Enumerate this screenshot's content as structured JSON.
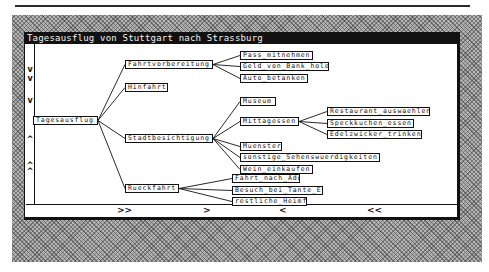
{
  "window": {
    "title": "Tagesausflug von Stuttgart nach Strassburg"
  },
  "scrollbars": {
    "vertical_marks": [
      {
        "glyph": "v",
        "y": 69
      },
      {
        "glyph": "v",
        "y": 78
      },
      {
        "glyph": "v",
        "y": 100
      },
      {
        "glyph": "^",
        "y": 139
      },
      {
        "glyph": "^",
        "y": 165
      },
      {
        "glyph": "^",
        "y": 171
      }
    ],
    "horizontal_marks": [
      {
        "glyph": ">>",
        "x": 116
      },
      {
        "glyph": ">",
        "x": 202
      },
      {
        "glyph": "<",
        "x": 278
      },
      {
        "glyph": "<<",
        "x": 366
      }
    ]
  },
  "tree": {
    "root": {
      "id": "tagesausflug",
      "label": "Tagesausflug",
      "x": 33,
      "y": 116,
      "w": 65
    },
    "nodes": [
      {
        "id": "fahrtvorbereitung",
        "label": "Fahrtvorbereitung",
        "parent": "tagesausflug",
        "x": 125,
        "y": 60,
        "w": 88
      },
      {
        "id": "hinfahrt",
        "label": "Hinfahrt",
        "parent": "tagesausflug",
        "x": 125,
        "y": 83,
        "w": 43
      },
      {
        "id": "stadtbesichtigung",
        "label": "Stadtbesichtigung",
        "parent": "tagesausflug",
        "x": 125,
        "y": 134,
        "w": 88
      },
      {
        "id": "rueckfahrt",
        "label": "Rueckfahrt",
        "parent": "tagesausflug",
        "x": 125,
        "y": 184,
        "w": 54
      },
      {
        "id": "pass",
        "label": "Pass_mitnehmen",
        "parent": "fahrtvorbereitung",
        "x": 240,
        "y": 51,
        "w": 73
      },
      {
        "id": "geld",
        "label": "Geld_von_Bank_holen",
        "parent": "fahrtvorbereitung",
        "x": 240,
        "y": 62,
        "w": 89
      },
      {
        "id": "auto",
        "label": "Auto_betanken",
        "parent": "fahrtvorbereitung",
        "x": 240,
        "y": 74,
        "w": 68
      },
      {
        "id": "museum",
        "label": "Museum",
        "parent": "stadtbesichtigung",
        "x": 240,
        "y": 97,
        "w": 36
      },
      {
        "id": "mittagessen",
        "label": "Mittagessen",
        "parent": "stadtbesichtigung",
        "x": 240,
        "y": 117,
        "w": 59
      },
      {
        "id": "muenster",
        "label": "Muenster",
        "parent": "stadtbesichtigung",
        "x": 240,
        "y": 142,
        "w": 42
      },
      {
        "id": "sonstige",
        "label": "sonstige_Sehenswuerdigkeiten",
        "parent": "stadtbesichtigung",
        "x": 240,
        "y": 153,
        "w": 140
      },
      {
        "id": "wein",
        "label": "Wein_einkaufen",
        "parent": "stadtbesichtigung",
        "x": 240,
        "y": 165,
        "w": 73
      },
      {
        "id": "restaurant",
        "label": "Restaurant_auswaehlen",
        "parent": "mittagessen",
        "x": 327,
        "y": 107,
        "w": 103
      },
      {
        "id": "speckkuchen",
        "label": "Speckkuchen_essen",
        "parent": "mittagessen",
        "x": 327,
        "y": 119,
        "w": 87
      },
      {
        "id": "edelzwicker",
        "label": "Edelzwicker_trinken",
        "parent": "mittagessen",
        "x": 327,
        "y": 130,
        "w": 95
      },
      {
        "id": "adorf",
        "label": "Fahrt_nach_Adorf",
        "parent": "rueckfahrt",
        "x": 232,
        "y": 174,
        "w": 68
      },
      {
        "id": "tante",
        "label": "Besuch_bei_Tante_Emilie",
        "parent": "rueckfahrt",
        "x": 232,
        "y": 186,
        "w": 91
      },
      {
        "id": "heimfahrt",
        "label": "restliche_Heimfahrt",
        "parent": "rueckfahrt",
        "x": 232,
        "y": 197,
        "w": 75
      }
    ]
  },
  "colors": {
    "ink": "#111111",
    "paper": "#ffffff",
    "dither": "#b4b4b4"
  }
}
